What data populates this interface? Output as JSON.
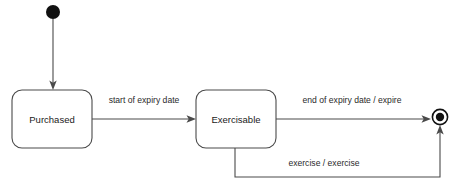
{
  "diagram": {
    "type": "uml-state-machine",
    "title": "",
    "background_color": "#ffffff",
    "stroke_color": "#4a4a4a",
    "text_color": "#1a1a1a",
    "node_fill_color": "#111111",
    "states": [
      {
        "id": "initial",
        "kind": "initial-pseudostate",
        "label": "",
        "cx": 53,
        "cy": 12,
        "r": 7
      },
      {
        "id": "purchased",
        "kind": "state",
        "label": "Purchased",
        "x": 12,
        "y": 90,
        "width": 80,
        "height": 58
      },
      {
        "id": "exercisable",
        "kind": "state",
        "label": "Exercisable",
        "x": 196,
        "y": 90,
        "width": 80,
        "height": 58
      },
      {
        "id": "final",
        "kind": "final-state",
        "label": "",
        "cx": 440,
        "cy": 117,
        "outer_r": 8,
        "inner_r": 4.2
      }
    ],
    "transitions": [
      {
        "id": "t-initial-purchased",
        "from": "initial",
        "to": "purchased",
        "label": "",
        "label_x": 0,
        "label_y": 0
      },
      {
        "id": "t-purchased-exercisable",
        "from": "purchased",
        "to": "exercisable",
        "label": "start of expiry date",
        "label_x": 144,
        "label_y": 101
      },
      {
        "id": "t-exercisable-final",
        "from": "exercisable",
        "to": "final",
        "label": "end of expiry date / expire",
        "label_x": 352,
        "label_y": 101
      },
      {
        "id": "t-exercisable-final-exercise",
        "from": "exercisable",
        "to": "final",
        "label": "exercise / exercise",
        "label_x": 324,
        "label_y": 164
      }
    ]
  }
}
